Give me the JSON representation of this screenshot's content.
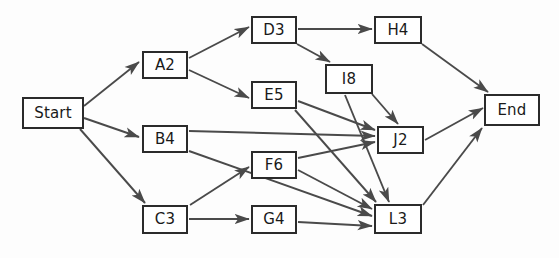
{
  "diagram": {
    "type": "directed-graph",
    "background_color": "#fdfdfd",
    "node_fill_color": "#ffffff",
    "node_border_color": "#2b2b2b",
    "node_text_color": "#1a1a1a",
    "edge_color": "#4a4a4a",
    "nodes": [
      {
        "id": "Start",
        "label": "Start",
        "x": 22,
        "y": 97,
        "w": 62,
        "h": 32
      },
      {
        "id": "A2",
        "label": "A2",
        "x": 142,
        "y": 51,
        "w": 46,
        "h": 28
      },
      {
        "id": "B4",
        "label": "B4",
        "x": 142,
        "y": 125,
        "w": 46,
        "h": 28
      },
      {
        "id": "C3",
        "label": "C3",
        "x": 142,
        "y": 205,
        "w": 46,
        "h": 29
      },
      {
        "id": "D3",
        "label": "D3",
        "x": 251,
        "y": 16,
        "w": 46,
        "h": 28
      },
      {
        "id": "E5",
        "label": "E5",
        "x": 251,
        "y": 81,
        "w": 46,
        "h": 28
      },
      {
        "id": "F6",
        "label": "F6",
        "x": 251,
        "y": 151,
        "w": 46,
        "h": 28
      },
      {
        "id": "G4",
        "label": "G4",
        "x": 251,
        "y": 205,
        "w": 46,
        "h": 29
      },
      {
        "id": "H4",
        "label": "H4",
        "x": 374,
        "y": 16,
        "w": 48,
        "h": 28
      },
      {
        "id": "I8",
        "label": "I8",
        "x": 325,
        "y": 64,
        "w": 48,
        "h": 30
      },
      {
        "id": "J2",
        "label": "J2",
        "x": 377,
        "y": 126,
        "w": 47,
        "h": 28
      },
      {
        "id": "L3",
        "label": "L3",
        "x": 374,
        "y": 204,
        "w": 48,
        "h": 30
      },
      {
        "id": "End",
        "label": "End",
        "x": 484,
        "y": 94,
        "w": 56,
        "h": 32
      }
    ],
    "edges": [
      {
        "from": "Start",
        "to": "A2",
        "x1": 84,
        "y1": 106,
        "x2": 139,
        "y2": 62
      },
      {
        "from": "Start",
        "to": "B4",
        "x1": 84,
        "y1": 118,
        "x2": 139,
        "y2": 137
      },
      {
        "from": "Start",
        "to": "C3",
        "x1": 80,
        "y1": 129,
        "x2": 145,
        "y2": 203
      },
      {
        "from": "A2",
        "to": "D3",
        "x1": 189,
        "y1": 58,
        "x2": 249,
        "y2": 27
      },
      {
        "from": "A2",
        "to": "E5",
        "x1": 189,
        "y1": 70,
        "x2": 249,
        "y2": 98
      },
      {
        "from": "B4",
        "to": "J2",
        "x1": 189,
        "y1": 131,
        "x2": 375,
        "y2": 136
      },
      {
        "from": "B4",
        "to": "L3",
        "x1": 189,
        "y1": 151,
        "x2": 372,
        "y2": 216
      },
      {
        "from": "C3",
        "to": "F6",
        "x1": 190,
        "y1": 205,
        "x2": 249,
        "y2": 167
      },
      {
        "from": "C3",
        "to": "G4",
        "x1": 189,
        "y1": 219,
        "x2": 249,
        "y2": 219
      },
      {
        "from": "D3",
        "to": "H4",
        "x1": 298,
        "y1": 29,
        "x2": 372,
        "y2": 29
      },
      {
        "from": "D3",
        "to": "I8",
        "x1": 297,
        "y1": 44,
        "x2": 330,
        "y2": 62
      },
      {
        "from": "E5",
        "to": "J2",
        "x1": 298,
        "y1": 101,
        "x2": 375,
        "y2": 130
      },
      {
        "from": "E5",
        "to": "L3",
        "x1": 295,
        "y1": 110,
        "x2": 376,
        "y2": 202
      },
      {
        "from": "F6",
        "to": "J2",
        "x1": 298,
        "y1": 158,
        "x2": 375,
        "y2": 142
      },
      {
        "from": "F6",
        "to": "L3",
        "x1": 298,
        "y1": 170,
        "x2": 372,
        "y2": 209
      },
      {
        "from": "G4",
        "to": "L3",
        "x1": 298,
        "y1": 222,
        "x2": 372,
        "y2": 226
      },
      {
        "from": "I8",
        "to": "J2",
        "x1": 372,
        "y1": 94,
        "x2": 398,
        "y2": 124
      },
      {
        "from": "I8",
        "to": "L3",
        "x1": 345,
        "y1": 95,
        "x2": 389,
        "y2": 202
      },
      {
        "from": "H4",
        "to": "End",
        "x1": 422,
        "y1": 44,
        "x2": 488,
        "y2": 92
      },
      {
        "from": "J2",
        "to": "End",
        "x1": 425,
        "y1": 140,
        "x2": 483,
        "y2": 108
      },
      {
        "from": "L3",
        "to": "End",
        "x1": 423,
        "y1": 205,
        "x2": 482,
        "y2": 128
      }
    ]
  }
}
